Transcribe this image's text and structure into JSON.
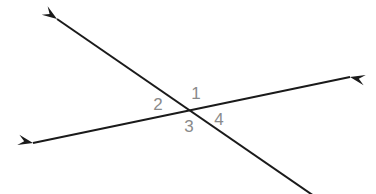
{
  "figure": {
    "type": "geometry-diagram",
    "background_color": "#ffffff",
    "canvas": {
      "width": 376,
      "height": 194
    }
  },
  "style": {
    "line_color": "#1a1a1a",
    "line_width": 2,
    "label_color": "#8a8a8a",
    "label_font_size": 17
  },
  "geometry": {
    "intersection": {
      "x": 192,
      "y": 112
    },
    "lines": [
      {
        "id": "line-steep",
        "name": "descending-line",
        "from": {
          "x": 57,
          "y": 19
        },
        "to": {
          "x": 314,
          "y": 196
        },
        "arrow_start": true,
        "arrow_end": false,
        "slope": 0.67
      },
      {
        "id": "line-shallow",
        "name": "ascending-line",
        "from": {
          "x": 33,
          "y": 143
        },
        "to": {
          "x": 350,
          "y": 77
        },
        "arrow_start": true,
        "arrow_end": true,
        "slope": -0.208
      }
    ],
    "arrowheads": [
      {
        "id": "arrow-upper-left",
        "name": "arrowhead-upper-left",
        "tip": {
          "x": 57,
          "y": 19
        },
        "angle_deg": 214.6
      },
      {
        "id": "arrow-lower-left",
        "name": "arrowhead-lower-left",
        "tip": {
          "x": 33,
          "y": 143
        },
        "angle_deg": 191.8
      },
      {
        "id": "arrow-right",
        "name": "arrowhead-right",
        "tip": {
          "x": 350,
          "y": 77
        },
        "angle_deg": 11.8
      }
    ]
  },
  "labels": [
    {
      "id": "label-1",
      "text": "1",
      "x": 196,
      "y": 99,
      "position": "top",
      "angle_region": "upper"
    },
    {
      "id": "label-2",
      "text": "2",
      "x": 158,
      "y": 110,
      "position": "left",
      "angle_region": "left"
    },
    {
      "id": "label-3",
      "text": "3",
      "x": 189,
      "y": 132,
      "position": "bottom",
      "angle_region": "lower"
    },
    {
      "id": "label-4",
      "text": "4",
      "x": 219,
      "y": 125,
      "position": "right",
      "angle_region": "right"
    }
  ]
}
